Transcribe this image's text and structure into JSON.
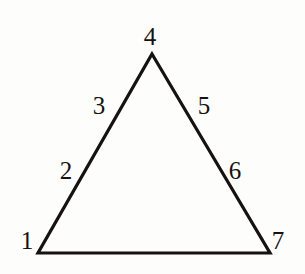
{
  "figure": {
    "kind": "labeled-triangle-diagram",
    "background_color": "#fdfdfc",
    "stroke_color": "#15120f",
    "stroke_width": 3,
    "label_color": "#15120f",
    "canvas": {
      "width": 305,
      "height": 274
    }
  },
  "shape": {
    "name": "triangle",
    "vertices": [
      {
        "id": "apex",
        "x": 152,
        "y": 54
      },
      {
        "id": "bottom-left",
        "x": 38,
        "y": 253
      },
      {
        "id": "bottom-right",
        "x": 270,
        "y": 253
      }
    ],
    "edges": [
      {
        "id": "left-edge",
        "from": "bottom-left",
        "to": "apex"
      },
      {
        "id": "right-edge",
        "from": "apex",
        "to": "bottom-right"
      },
      {
        "id": "bottom-edge",
        "from": "bottom-right",
        "to": "bottom-left"
      }
    ]
  },
  "labels": {
    "vertex_bottom_left": "1",
    "edge_left_lower": "2",
    "edge_left_upper": "3",
    "vertex_apex": "4",
    "edge_right_upper": "5",
    "edge_right_lower": "6",
    "vertex_bottom_right": "7"
  },
  "label_sequence": [
    "1",
    "2",
    "3",
    "4",
    "5",
    "6",
    "7"
  ]
}
